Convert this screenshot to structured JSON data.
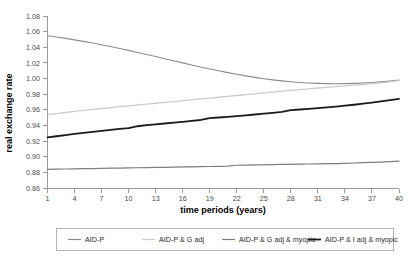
{
  "chart_data": {
    "type": "line",
    "title": "",
    "xlabel": "time periods (years)",
    "ylabel": "real exchange rate",
    "xlim": [
      1,
      40
    ],
    "ylim": [
      0.86,
      1.08
    ],
    "grid": false,
    "legend_position": "bottom",
    "xticks": [
      1,
      4,
      7,
      10,
      13,
      16,
      19,
      22,
      25,
      28,
      31,
      34,
      37,
      40
    ],
    "xtick_labels": [
      "1",
      "4",
      "7",
      "10",
      "13",
      "16",
      "19",
      "22",
      "25",
      "28",
      "31",
      "34",
      "37",
      "40"
    ],
    "yticks": [
      0.86,
      0.88,
      0.9,
      0.92,
      0.94,
      0.96,
      0.98,
      1.0,
      1.02,
      1.04,
      1.06,
      1.08
    ],
    "ytick_labels": [
      "0.86",
      "0.88",
      "0.90",
      "0.92",
      "0.94",
      "0.96",
      "0.98",
      "1.00",
      "1.02",
      "1.04",
      "1.06",
      "1.08"
    ],
    "x": [
      1,
      2,
      3,
      4,
      5,
      6,
      7,
      8,
      9,
      10,
      11,
      12,
      13,
      14,
      15,
      16,
      17,
      18,
      19,
      20,
      21,
      22,
      23,
      24,
      25,
      26,
      27,
      28,
      29,
      30,
      31,
      32,
      33,
      34,
      35,
      36,
      37,
      38,
      39,
      40
    ],
    "series": [
      {
        "name": "AID-P",
        "color": "#8c8c8c",
        "width": 1.1,
        "values": [
          1.0548,
          1.0532,
          1.0514,
          1.0495,
          1.0475,
          1.0454,
          1.0432,
          1.0409,
          1.0385,
          1.036,
          1.0334,
          1.0308,
          1.0281,
          1.0254,
          1.0227,
          1.02,
          1.0174,
          1.0148,
          1.0123,
          1.0099,
          1.0076,
          1.0054,
          1.0034,
          1.0015,
          0.9998,
          0.9983,
          0.997,
          0.9959,
          0.995,
          0.9943,
          0.9938,
          0.9935,
          0.9934,
          0.9935,
          0.9938,
          0.9943,
          0.995,
          0.9958,
          0.9968,
          0.998
        ]
      },
      {
        "name": "AID-P & G adj",
        "color": "#cccccc",
        "width": 1.3,
        "values": [
          0.9538,
          0.9552,
          0.9566,
          0.958,
          0.9593,
          0.9605,
          0.9617,
          0.9629,
          0.964,
          0.9651,
          0.9662,
          0.9673,
          0.9684,
          0.9695,
          0.9706,
          0.9717,
          0.9728,
          0.9739,
          0.975,
          0.9761,
          0.9772,
          0.9783,
          0.9794,
          0.9805,
          0.9816,
          0.9827,
          0.9838,
          0.9849,
          0.9859,
          0.9869,
          0.9879,
          0.9888,
          0.9897,
          0.9906,
          0.9915,
          0.9924,
          0.9934,
          0.9945,
          0.9958,
          0.9975
        ]
      },
      {
        "name": "AID-P & G adj & myopic",
        "color": "#7e7e7e",
        "width": 1.2,
        "values": [
          0.8838,
          0.8841,
          0.8843,
          0.8845,
          0.8847,
          0.8849,
          0.8851,
          0.8853,
          0.8855,
          0.8857,
          0.8859,
          0.8861,
          0.8863,
          0.8865,
          0.8867,
          0.8869,
          0.8871,
          0.8873,
          0.8875,
          0.8877,
          0.888,
          0.8891,
          0.8893,
          0.8895,
          0.8897,
          0.8899,
          0.8901,
          0.8903,
          0.8905,
          0.8907,
          0.8909,
          0.8911,
          0.8913,
          0.8916,
          0.892,
          0.8924,
          0.8928,
          0.8932,
          0.8937,
          0.8943
        ]
      },
      {
        "name": "AID-P & I adj & myopic",
        "color": "#1a1a1a",
        "width": 1.8,
        "values": [
          0.9247,
          0.9262,
          0.9277,
          0.9291,
          0.9305,
          0.9318,
          0.9331,
          0.9343,
          0.9355,
          0.9367,
          0.939,
          0.9404,
          0.9415,
          0.9425,
          0.9436,
          0.9447,
          0.9458,
          0.947,
          0.9493,
          0.9502,
          0.9511,
          0.952,
          0.953,
          0.954,
          0.9551,
          0.9562,
          0.9574,
          0.9595,
          0.9604,
          0.9613,
          0.9622,
          0.9632,
          0.9642,
          0.9653,
          0.9665,
          0.9678,
          0.9692,
          0.9707,
          0.9723,
          0.974
        ]
      }
    ]
  },
  "legend": {
    "items": [
      {
        "label": "AID-P"
      },
      {
        "label": "AID-P & G adj"
      },
      {
        "label": "AID-P & G adj & myopic"
      },
      {
        "label": "AID-P & I adj & myopic"
      }
    ]
  }
}
